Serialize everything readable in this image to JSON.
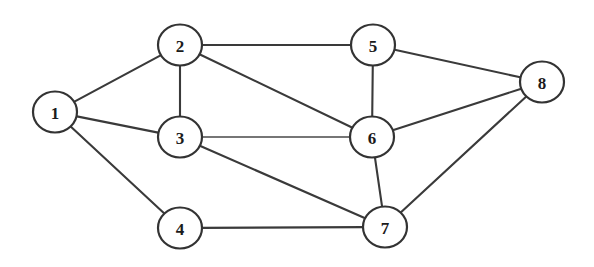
{
  "figure": {
    "background_color": "#ffffff",
    "stroke_color": "#3a3a3a",
    "node_fill_color": "#ffffff",
    "node_stroke_color": "#333333",
    "label_color": "#1b1b1b",
    "width": 594,
    "height": 267
  },
  "chart_data": {
    "type": "diagram",
    "diagram_kind": "undirected-graph",
    "node_radius": 22,
    "node_count": 8,
    "edge_count": 14,
    "nodes": [
      {
        "id": "1",
        "label": "1",
        "x": 55,
        "y": 112
      },
      {
        "id": "2",
        "label": "2",
        "x": 180,
        "y": 45
      },
      {
        "id": "3",
        "label": "3",
        "x": 180,
        "y": 137
      },
      {
        "id": "4",
        "label": "4",
        "x": 180,
        "y": 228
      },
      {
        "id": "5",
        "label": "5",
        "x": 373,
        "y": 45
      },
      {
        "id": "6",
        "label": "6",
        "x": 372,
        "y": 137
      },
      {
        "id": "7",
        "label": "7",
        "x": 385,
        "y": 227
      },
      {
        "id": "8",
        "label": "8",
        "x": 542,
        "y": 82
      }
    ],
    "edges": [
      {
        "source": "1",
        "target": "2",
        "weight": null,
        "style": "solid"
      },
      {
        "source": "1",
        "target": "3",
        "weight": null,
        "style": "solid"
      },
      {
        "source": "1",
        "target": "4",
        "weight": null,
        "style": "solid"
      },
      {
        "source": "2",
        "target": "3",
        "weight": null,
        "style": "solid"
      },
      {
        "source": "2",
        "target": "5",
        "weight": null,
        "style": "solid"
      },
      {
        "source": "2",
        "target": "6",
        "weight": null,
        "style": "solid"
      },
      {
        "source": "3",
        "target": "6",
        "weight": null,
        "style": "thin"
      },
      {
        "source": "3",
        "target": "7",
        "weight": null,
        "style": "solid"
      },
      {
        "source": "4",
        "target": "7",
        "weight": null,
        "style": "solid"
      },
      {
        "source": "5",
        "target": "6",
        "weight": null,
        "style": "solid"
      },
      {
        "source": "5",
        "target": "8",
        "weight": null,
        "style": "solid"
      },
      {
        "source": "6",
        "target": "7",
        "weight": null,
        "style": "solid"
      },
      {
        "source": "6",
        "target": "8",
        "weight": null,
        "style": "solid"
      },
      {
        "source": "7",
        "target": "8",
        "weight": null,
        "style": "solid"
      }
    ],
    "adjacency": {
      "1": [
        "2",
        "3",
        "4"
      ],
      "2": [
        "1",
        "3",
        "5",
        "6"
      ],
      "3": [
        "1",
        "2",
        "6",
        "7"
      ],
      "4": [
        "1",
        "7"
      ],
      "5": [
        "2",
        "6",
        "8"
      ],
      "6": [
        "2",
        "3",
        "5",
        "7",
        "8"
      ],
      "7": [
        "3",
        "4",
        "6",
        "8"
      ],
      "8": [
        "5",
        "6",
        "7"
      ]
    },
    "degrees": {
      "1": 3,
      "2": 4,
      "3": 4,
      "4": 2,
      "5": 3,
      "6": 5,
      "7": 4,
      "8": 3
    }
  }
}
